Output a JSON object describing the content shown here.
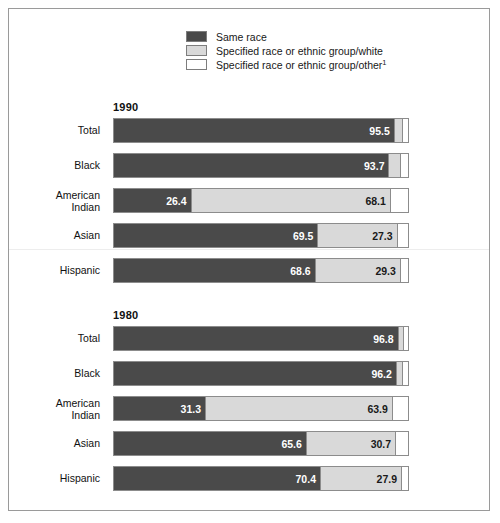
{
  "legend": {
    "items": [
      {
        "swatch": "#4a4a4a",
        "label": "Same race",
        "sup": ""
      },
      {
        "swatch": "#d9d9d9",
        "label": "Specified race or ethnic group/white",
        "sup": ""
      },
      {
        "swatch": "#ffffff",
        "label": "Specified race or ethnic group/other",
        "sup": "1"
      }
    ]
  },
  "colors": {
    "same_race": "#4a4a4a",
    "group_white": "#d9d9d9",
    "group_other": "#ffffff",
    "border": "#8c8c8c",
    "frame": "#9a9a9a"
  },
  "panels": [
    {
      "title": "1990",
      "rows": [
        {
          "label": "Total",
          "label_lines": [
            "Total"
          ],
          "same_race": 95.5,
          "group_white": 3.0,
          "group_other": 1.5,
          "labels": {
            "same_race": "95.5",
            "group_white": "",
            "group_other": ""
          }
        },
        {
          "label": "Black",
          "label_lines": [
            "Black"
          ],
          "same_race": 93.7,
          "group_white": 4.2,
          "group_other": 2.1,
          "labels": {
            "same_race": "93.7",
            "group_white": "",
            "group_other": ""
          }
        },
        {
          "label": "American Indian",
          "label_lines": [
            "American",
            "Indian"
          ],
          "same_race": 26.4,
          "group_white": 68.1,
          "group_other": 5.5,
          "labels": {
            "same_race": "26.4",
            "group_white": "68.1",
            "group_other": ""
          }
        },
        {
          "label": "Asian",
          "label_lines": [
            "Asian"
          ],
          "same_race": 69.5,
          "group_white": 27.3,
          "group_other": 3.2,
          "labels": {
            "same_race": "69.5",
            "group_white": "27.3",
            "group_other": ""
          }
        },
        {
          "label": "Hispanic",
          "label_lines": [
            "Hispanic"
          ],
          "same_race": 68.6,
          "group_white": 29.3,
          "group_other": 2.1,
          "labels": {
            "same_race": "68.6",
            "group_white": "29.3",
            "group_other": ""
          }
        }
      ]
    },
    {
      "title": "1980",
      "rows": [
        {
          "label": "Total",
          "label_lines": [
            "Total"
          ],
          "same_race": 96.8,
          "group_white": 2.2,
          "group_other": 1.0,
          "labels": {
            "same_race": "96.8",
            "group_white": "",
            "group_other": ""
          }
        },
        {
          "label": "Black",
          "label_lines": [
            "Black"
          ],
          "same_race": 96.2,
          "group_white": 2.6,
          "group_other": 1.2,
          "labels": {
            "same_race": "96.2",
            "group_white": "",
            "group_other": ""
          }
        },
        {
          "label": "American Indian",
          "label_lines": [
            "American",
            "Indian"
          ],
          "same_race": 31.3,
          "group_white": 63.9,
          "group_other": 4.8,
          "labels": {
            "same_race": "31.3",
            "group_white": "63.9",
            "group_other": ""
          }
        },
        {
          "label": "Asian",
          "label_lines": [
            "Asian"
          ],
          "same_race": 65.6,
          "group_white": 30.7,
          "group_other": 3.7,
          "labels": {
            "same_race": "65.6",
            "group_white": "30.7",
            "group_other": ""
          }
        },
        {
          "label": "Hispanic",
          "label_lines": [
            "Hispanic"
          ],
          "same_race": 70.4,
          "group_white": 27.9,
          "group_other": 1.7,
          "labels": {
            "same_race": "70.4",
            "group_white": "27.9",
            "group_other": ""
          }
        }
      ]
    }
  ],
  "chart_data": {
    "type": "bar",
    "title": "",
    "subtype": "100% stacked horizontal bar, two panels",
    "xlabel": "",
    "ylabel": "",
    "xlim": [
      0,
      100
    ],
    "grid": false,
    "legend_position": "top-center",
    "legend_entries": [
      "Same race",
      "Specified race or ethnic group/white",
      "Specified race or ethnic group/other1"
    ],
    "series": [
      {
        "name": "Same race",
        "color": "#4a4a4a"
      },
      {
        "name": "Specified race or ethnic group/white",
        "color": "#d9d9d9"
      },
      {
        "name": "Specified race or ethnic group/other",
        "color": "#ffffff"
      }
    ],
    "panels": [
      {
        "name": "1990",
        "categories": [
          "Total",
          "Black",
          "American Indian",
          "Asian",
          "Hispanic"
        ],
        "values": {
          "Same race": [
            95.5,
            93.7,
            26.4,
            69.5,
            68.6
          ],
          "Specified race or ethnic group/white": [
            3.0,
            4.2,
            68.1,
            27.3,
            29.3
          ],
          "Specified race or ethnic group/other": [
            1.5,
            2.1,
            5.5,
            3.2,
            2.1
          ]
        },
        "labeled_values": {
          "Total": [
            "95.5"
          ],
          "Black": [
            "93.7"
          ],
          "American Indian": [
            "26.4",
            "68.1"
          ],
          "Asian": [
            "69.5",
            "27.3"
          ],
          "Hispanic": [
            "68.6",
            "29.3"
          ]
        }
      },
      {
        "name": "1980",
        "categories": [
          "Total",
          "Black",
          "American Indian",
          "Asian",
          "Hispanic"
        ],
        "values": {
          "Same race": [
            96.8,
            96.2,
            31.3,
            65.6,
            70.4
          ],
          "Specified race or ethnic group/white": [
            2.2,
            2.6,
            63.9,
            30.7,
            27.9
          ],
          "Specified race or ethnic group/other": [
            1.0,
            1.2,
            4.8,
            3.7,
            1.7
          ]
        },
        "labeled_values": {
          "Total": [
            "96.8"
          ],
          "Black": [
            "96.2"
          ],
          "American Indian": [
            "31.3",
            "63.9"
          ],
          "Asian": [
            "65.6",
            "30.7"
          ],
          "Hispanic": [
            "70.4",
            "27.9"
          ]
        }
      }
    ],
    "footnote_marker": "1"
  }
}
